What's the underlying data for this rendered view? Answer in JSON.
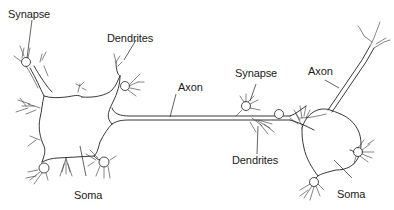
{
  "diagram": {
    "labels": {
      "left_synapse": "Synapse",
      "left_dendrites": "Dendrites",
      "axon_middle": "Axon",
      "left_soma": "Soma",
      "right_synapse": "Synapse",
      "right_axon": "Axon",
      "right_dendrites": "Dendrites",
      "right_soma": "Soma"
    },
    "colors": {
      "stroke": "#222222",
      "background": "#ffffff",
      "text": "#1a1a1a"
    }
  }
}
